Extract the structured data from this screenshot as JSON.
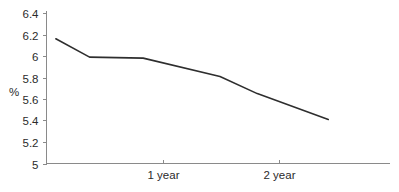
{
  "chart_data": {
    "type": "line",
    "title": "",
    "subtitle": "",
    "xlabel": "",
    "ylabel": "%",
    "grid": false,
    "legend": false,
    "legend_position": "none",
    "xlim": [
      0,
      2.95
    ],
    "ylim": [
      5,
      6.4
    ],
    "yticks": [
      5,
      5.2,
      5.4,
      5.6,
      5.8,
      6,
      6.2,
      6.4
    ],
    "ytick_labels": [
      "5",
      "5.2",
      "5.4",
      "5.6",
      "5.8",
      "6",
      "6.2",
      "6.4"
    ],
    "xticks": [
      1,
      2
    ],
    "xtick_labels": [
      "1 year",
      "2 year"
    ],
    "series": [
      {
        "name": "rate",
        "color": "#2e2e2e",
        "x": [
          0.08,
          0.37,
          0.83,
          1.49,
          1.81,
          2.42
        ],
        "y": [
          6.16,
          5.99,
          5.98,
          5.81,
          5.65,
          5.41
        ]
      }
    ],
    "annotations": []
  },
  "colors": {
    "line": "#2e2e2e",
    "axis": "#8a8a8a",
    "text": "#2b2b2b",
    "background": "#ffffff"
  }
}
